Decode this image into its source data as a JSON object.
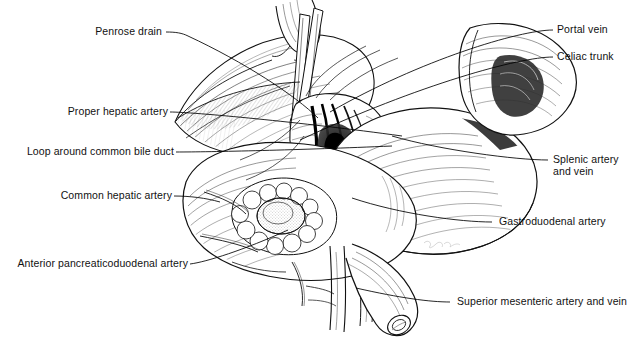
{
  "figure": {
    "style": "pen-and-ink line drawing, black on white",
    "background_color": "#ffffff",
    "ink_color": "#000000",
    "artist_signature": "illegible cursive signature",
    "caption_fragment": ""
  },
  "labels": {
    "left": [
      {
        "id": "penrose-drain",
        "text": "Penrose drain"
      },
      {
        "id": "proper-hepatic-artery",
        "text": "Proper hepatic artery"
      },
      {
        "id": "loop-around-common-bile-duct",
        "text": "Loop around common bile duct"
      },
      {
        "id": "common-hepatic-artery",
        "text": "Common hepatic artery"
      },
      {
        "id": "anterior-pancreaticoduodenal-artery",
        "text": "Anterior pancreaticoduodenal artery"
      }
    ],
    "right": [
      {
        "id": "portal-vein",
        "text": "Portal vein",
        "line2": ""
      },
      {
        "id": "celiac-trunk",
        "text": "Celiac trunk",
        "line2": ""
      },
      {
        "id": "splenic-artery-and-vein",
        "text": "Splenic artery",
        "line2": "and vein"
      },
      {
        "id": "gastroduodenal-artery",
        "text": "Gastroduodenal artery",
        "line2": ""
      },
      {
        "id": "superior-mesenteric-artery-and-vein",
        "text": "Superior mesenteric artery and vein",
        "line2": ""
      }
    ]
  }
}
